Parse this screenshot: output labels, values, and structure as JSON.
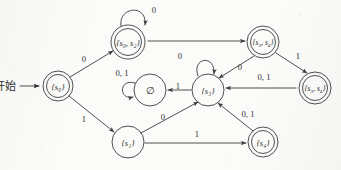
{
  "figure": {
    "kind": "state-transition-diagram",
    "ink_color": "#3d3d3d",
    "paper_color": "#fbfbf9",
    "start_label": "开始"
  },
  "states": [
    {
      "id": "s0",
      "label": "{s₀}",
      "accepting": true,
      "cx": 58,
      "cy": 86,
      "r": 15
    },
    {
      "id": "s0s2",
      "label": "{s₀, s₂}",
      "accepting": true,
      "cx": 128,
      "cy": 42,
      "r": 17
    },
    {
      "id": "empty",
      "label": "∅",
      "accepting": false,
      "cx": 150,
      "cy": 90,
      "r": 16
    },
    {
      "id": "s3",
      "label": "{s₃}",
      "accepting": false,
      "cx": 208,
      "cy": 90,
      "r": 16
    },
    {
      "id": "s3s4a",
      "label": "{s₃, s₄}",
      "accepting": true,
      "cx": 263,
      "cy": 42,
      "r": 16
    },
    {
      "id": "s3s4b",
      "label": "{s₃, s₄}",
      "accepting": true,
      "cx": 315,
      "cy": 88,
      "r": 16
    },
    {
      "id": "s1",
      "label": "{s₁}",
      "accepting": false,
      "cx": 128,
      "cy": 142,
      "r": 16
    },
    {
      "id": "s4",
      "label": "{s₄}",
      "accepting": true,
      "cx": 263,
      "cy": 142,
      "r": 15
    }
  ],
  "transitions": [
    {
      "from": "start",
      "to": "s0",
      "label": "",
      "label_x": 0,
      "label_y": 0
    },
    {
      "from": "s0",
      "to": "s0s2",
      "label": "0",
      "label_x": 84,
      "label_y": 62
    },
    {
      "from": "s0",
      "to": "s1",
      "label": "1",
      "label_x": 84,
      "label_y": 122
    },
    {
      "from": "s0s2",
      "to": "s0s2",
      "label": "0",
      "label_x": 154,
      "label_y": 13
    },
    {
      "from": "s0s2",
      "to": "s3s4a",
      "label": "",
      "label_x": 0,
      "label_y": 0
    },
    {
      "from": "s3s4a",
      "to": "s3",
      "label": "0",
      "label_x": 240,
      "label_y": 70
    },
    {
      "from": "s3s4a",
      "to": "s3s4b",
      "label": "1",
      "label_x": 298,
      "label_y": 59
    },
    {
      "from": "s3s4b",
      "to": "s3",
      "label": "0, 1",
      "label_x": 264,
      "label_y": 80
    },
    {
      "from": "s3",
      "to": "s3",
      "label": "0",
      "label_x": 180,
      "label_y": 59
    },
    {
      "from": "s3",
      "to": "empty",
      "label": "1",
      "label_x": 178,
      "label_y": 89
    },
    {
      "from": "empty",
      "to": "empty",
      "label": "0, 1",
      "label_x": 122,
      "label_y": 76
    },
    {
      "from": "s1",
      "to": "s3",
      "label": "0",
      "label_x": 163,
      "label_y": 120
    },
    {
      "from": "s1",
      "to": "s4",
      "label": "1",
      "label_x": 197,
      "label_y": 137
    },
    {
      "from": "s4",
      "to": "s3",
      "label": "0, 1",
      "label_x": 248,
      "label_y": 117
    }
  ]
}
